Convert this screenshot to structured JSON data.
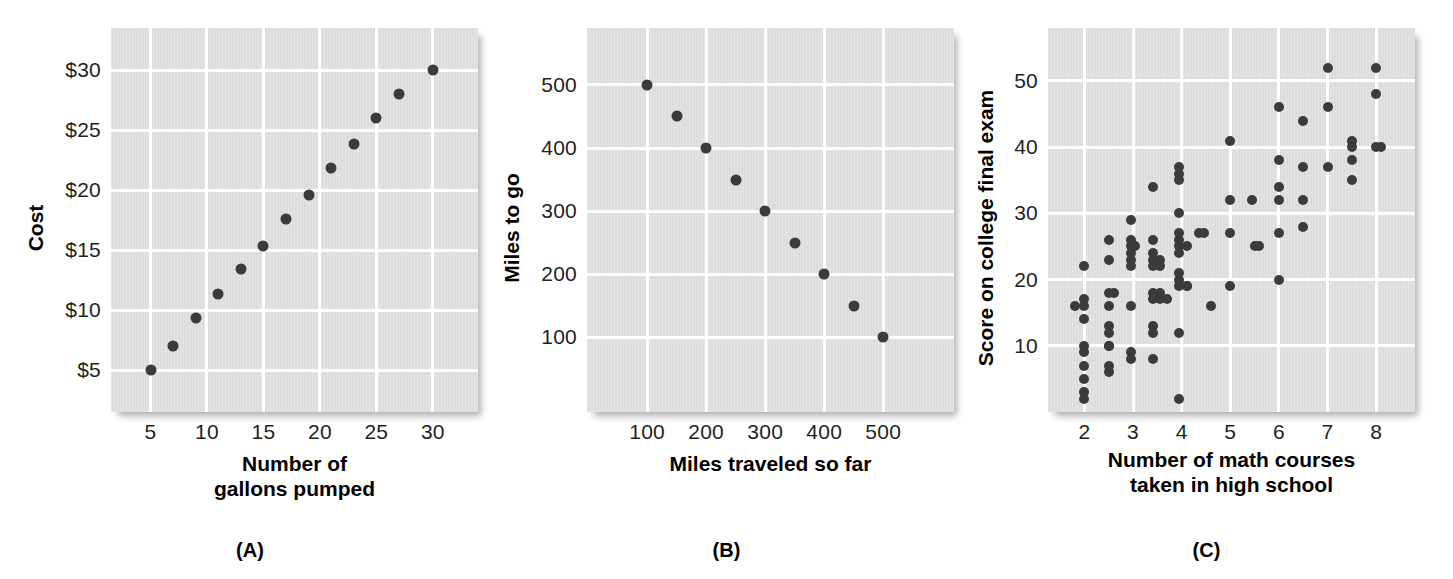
{
  "figure": {
    "dot_color": "#3b3b3b",
    "plot_background": "#dcdcdc",
    "gridline_color": "#ffffff"
  },
  "chart_data": [
    {
      "id": "A",
      "type": "scatter",
      "panel_label": "(A)",
      "title": "",
      "xlabel": "Number of\ngallons pumped",
      "xlabel_line1": "Number of",
      "xlabel_line2": "gallons pumped",
      "ylabel": "Cost",
      "xticks": [
        "5",
        "10",
        "15",
        "20",
        "25",
        "30"
      ],
      "xtick_values": [
        5,
        10,
        15,
        20,
        25,
        30
      ],
      "yticks": [
        "$5",
        "$10",
        "$15",
        "$20",
        "$25",
        "$30"
      ],
      "ytick_values": [
        5,
        10,
        15,
        20,
        25,
        30
      ],
      "xlim": [
        1.5,
        34
      ],
      "ylim": [
        1.5,
        33.5
      ],
      "grid": true,
      "legend": "none",
      "points": [
        {
          "x": 5,
          "y": 5.0
        },
        {
          "x": 7,
          "y": 7.0
        },
        {
          "x": 9,
          "y": 9.3
        },
        {
          "x": 11,
          "y": 11.3
        },
        {
          "x": 13,
          "y": 13.4
        },
        {
          "x": 15,
          "y": 15.3
        },
        {
          "x": 17,
          "y": 17.6
        },
        {
          "x": 19,
          "y": 19.6
        },
        {
          "x": 21,
          "y": 21.8
        },
        {
          "x": 23,
          "y": 23.8
        },
        {
          "x": 25,
          "y": 26.0
        },
        {
          "x": 27,
          "y": 28.0
        },
        {
          "x": 30,
          "y": 30.0
        }
      ]
    },
    {
      "id": "B",
      "type": "scatter",
      "panel_label": "(B)",
      "title": "",
      "xlabel": "Miles traveled so far",
      "xlabel_line1": "Miles traveled so far",
      "xlabel_line2": "",
      "ylabel": "Miles to go",
      "xticks": [
        "100",
        "200",
        "300",
        "400",
        "500"
      ],
      "xtick_values": [
        100,
        200,
        300,
        400,
        500
      ],
      "yticks": [
        "100",
        "200",
        "300",
        "400",
        "500"
      ],
      "ytick_values": [
        100,
        200,
        300,
        400,
        500
      ],
      "xlim": [
        -2,
        620
      ],
      "ylim": [
        -18,
        590
      ],
      "grid": true,
      "legend": "none",
      "points": [
        {
          "x": 100,
          "y": 500
        },
        {
          "x": 150,
          "y": 450
        },
        {
          "x": 200,
          "y": 400
        },
        {
          "x": 250,
          "y": 350
        },
        {
          "x": 300,
          "y": 300
        },
        {
          "x": 350,
          "y": 250
        },
        {
          "x": 400,
          "y": 200
        },
        {
          "x": 450,
          "y": 150
        },
        {
          "x": 500,
          "y": 100
        }
      ]
    },
    {
      "id": "C",
      "type": "scatter",
      "panel_label": "(C)",
      "title": "",
      "xlabel": "Number of math courses\ntaken in high school",
      "xlabel_line1": "Number of math courses",
      "xlabel_line2": "taken in high school",
      "ylabel": "Score on college final exam",
      "xticks": [
        "2",
        "3",
        "4",
        "5",
        "6",
        "7",
        "8"
      ],
      "xtick_values": [
        2,
        3,
        4,
        5,
        6,
        7,
        8
      ],
      "yticks": [
        "10",
        "20",
        "30",
        "40",
        "50"
      ],
      "ytick_values": [
        10,
        20,
        30,
        40,
        50
      ],
      "xlim": [
        1.25,
        8.8
      ],
      "ylim": [
        0,
        58
      ],
      "grid": true,
      "legend": "none",
      "points": [
        {
          "x": 1.8,
          "y": 16
        },
        {
          "x": 2.0,
          "y": 22
        },
        {
          "x": 2.0,
          "y": 17
        },
        {
          "x": 2.0,
          "y": 16
        },
        {
          "x": 2.0,
          "y": 14
        },
        {
          "x": 2.0,
          "y": 10
        },
        {
          "x": 2.0,
          "y": 9
        },
        {
          "x": 2.0,
          "y": 7
        },
        {
          "x": 2.0,
          "y": 5
        },
        {
          "x": 2.0,
          "y": 3
        },
        {
          "x": 2.0,
          "y": 2
        },
        {
          "x": 2.5,
          "y": 26
        },
        {
          "x": 2.5,
          "y": 23
        },
        {
          "x": 2.5,
          "y": 18
        },
        {
          "x": 2.5,
          "y": 16
        },
        {
          "x": 2.5,
          "y": 13
        },
        {
          "x": 2.5,
          "y": 12
        },
        {
          "x": 2.5,
          "y": 10
        },
        {
          "x": 2.5,
          "y": 10
        },
        {
          "x": 2.5,
          "y": 7
        },
        {
          "x": 2.5,
          "y": 6
        },
        {
          "x": 2.6,
          "y": 18
        },
        {
          "x": 2.95,
          "y": 29
        },
        {
          "x": 2.95,
          "y": 26
        },
        {
          "x": 2.95,
          "y": 25
        },
        {
          "x": 2.95,
          "y": 24
        },
        {
          "x": 2.95,
          "y": 23
        },
        {
          "x": 2.95,
          "y": 22
        },
        {
          "x": 2.95,
          "y": 16
        },
        {
          "x": 2.95,
          "y": 9
        },
        {
          "x": 2.95,
          "y": 8
        },
        {
          "x": 3.05,
          "y": 25
        },
        {
          "x": 3.4,
          "y": 34
        },
        {
          "x": 3.4,
          "y": 26
        },
        {
          "x": 3.4,
          "y": 24
        },
        {
          "x": 3.4,
          "y": 23
        },
        {
          "x": 3.4,
          "y": 22
        },
        {
          "x": 3.4,
          "y": 18
        },
        {
          "x": 3.4,
          "y": 17
        },
        {
          "x": 3.4,
          "y": 13
        },
        {
          "x": 3.4,
          "y": 12
        },
        {
          "x": 3.4,
          "y": 8
        },
        {
          "x": 3.55,
          "y": 23
        },
        {
          "x": 3.55,
          "y": 22
        },
        {
          "x": 3.55,
          "y": 18
        },
        {
          "x": 3.55,
          "y": 17
        },
        {
          "x": 3.7,
          "y": 17
        },
        {
          "x": 3.95,
          "y": 37
        },
        {
          "x": 3.95,
          "y": 36
        },
        {
          "x": 3.95,
          "y": 35
        },
        {
          "x": 3.95,
          "y": 30
        },
        {
          "x": 3.95,
          "y": 27
        },
        {
          "x": 3.95,
          "y": 26
        },
        {
          "x": 3.95,
          "y": 25
        },
        {
          "x": 3.95,
          "y": 24
        },
        {
          "x": 3.95,
          "y": 21
        },
        {
          "x": 3.95,
          "y": 20
        },
        {
          "x": 3.95,
          "y": 19
        },
        {
          "x": 3.95,
          "y": 12
        },
        {
          "x": 3.95,
          "y": 2
        },
        {
          "x": 4.1,
          "y": 25
        },
        {
          "x": 4.1,
          "y": 19
        },
        {
          "x": 4.1,
          "y": 19
        },
        {
          "x": 4.35,
          "y": 27
        },
        {
          "x": 4.45,
          "y": 27
        },
        {
          "x": 4.6,
          "y": 16
        },
        {
          "x": 5.0,
          "y": 41
        },
        {
          "x": 5.0,
          "y": 32
        },
        {
          "x": 5.0,
          "y": 27
        },
        {
          "x": 5.0,
          "y": 19
        },
        {
          "x": 5.45,
          "y": 32
        },
        {
          "x": 5.5,
          "y": 25
        },
        {
          "x": 5.6,
          "y": 25
        },
        {
          "x": 6.0,
          "y": 46
        },
        {
          "x": 6.0,
          "y": 38
        },
        {
          "x": 6.0,
          "y": 34
        },
        {
          "x": 6.0,
          "y": 32
        },
        {
          "x": 6.0,
          "y": 27
        },
        {
          "x": 6.0,
          "y": 20
        },
        {
          "x": 6.5,
          "y": 44
        },
        {
          "x": 6.5,
          "y": 37
        },
        {
          "x": 6.5,
          "y": 32
        },
        {
          "x": 6.5,
          "y": 28
        },
        {
          "x": 7.0,
          "y": 52
        },
        {
          "x": 7.0,
          "y": 46
        },
        {
          "x": 7.0,
          "y": 37
        },
        {
          "x": 7.5,
          "y": 41
        },
        {
          "x": 7.5,
          "y": 40
        },
        {
          "x": 7.5,
          "y": 38
        },
        {
          "x": 7.5,
          "y": 35
        },
        {
          "x": 8.0,
          "y": 52
        },
        {
          "x": 8.0,
          "y": 48
        },
        {
          "x": 8.0,
          "y": 40
        },
        {
          "x": 8.1,
          "y": 40
        }
      ]
    }
  ]
}
